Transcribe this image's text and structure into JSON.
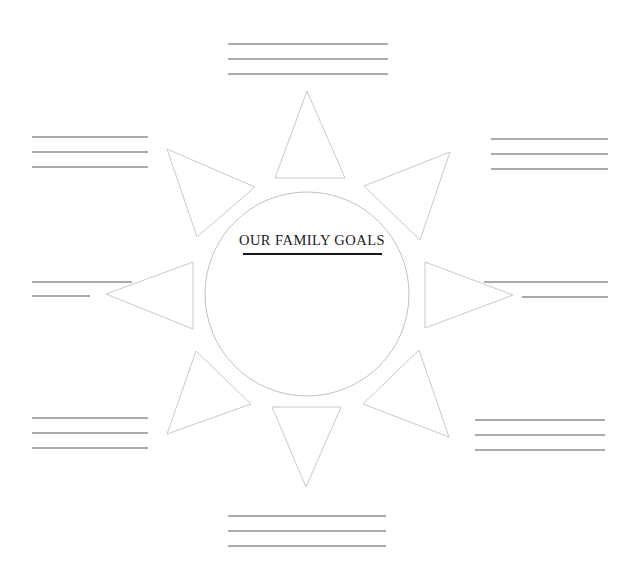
{
  "document": {
    "type": "graphic-organizer-worksheet",
    "theme": "sunburst",
    "title": "OUR FAMILY GOALS",
    "background_color": "#ffffff",
    "shape_stroke_color": "#c9c9cc",
    "line_stroke_color": "#8e8e92",
    "title_color": "#1a1a1a"
  },
  "center": {
    "label": "OUR FAMILY GOALS",
    "cx": 307,
    "cy": 294,
    "r": 102,
    "text_x": 312,
    "text_y": 245,
    "rule_x1": 243,
    "rule_x2": 382,
    "rule_y": 254
  },
  "rays": [
    {
      "name": "ray-top",
      "points": "307,91 345,178 275,178"
    },
    {
      "name": "ray-top-right",
      "points": "450,152 420,240 364,186"
    },
    {
      "name": "ray-right",
      "points": "513,295 425,328 425,262"
    },
    {
      "name": "ray-bottom-right",
      "points": "449,437 363,404 419,350"
    },
    {
      "name": "ray-bottom",
      "points": "306,487 272,407 341,407"
    },
    {
      "name": "ray-bottom-left",
      "points": "167,434 196,351 251,404"
    },
    {
      "name": "ray-left",
      "points": "106,294 193,262 193,329"
    },
    {
      "name": "ray-top-left",
      "points": "167,149 255,187 197,237"
    }
  ],
  "writing_groups": [
    {
      "name": "lines-top",
      "position": "top",
      "lines": [
        {
          "x1": 228,
          "x2": 388,
          "y": 44
        },
        {
          "x1": 228,
          "x2": 388,
          "y": 59
        },
        {
          "x1": 228,
          "x2": 388,
          "y": 74
        }
      ]
    },
    {
      "name": "lines-top-left",
      "position": "top-left",
      "lines": [
        {
          "x1": 32,
          "x2": 148,
          "y": 137
        },
        {
          "x1": 32,
          "x2": 148,
          "y": 152
        },
        {
          "x1": 32,
          "x2": 148,
          "y": 167
        }
      ]
    },
    {
      "name": "lines-top-right",
      "position": "top-right",
      "lines": [
        {
          "x1": 491,
          "x2": 608,
          "y": 139
        },
        {
          "x1": 491,
          "x2": 608,
          "y": 154
        },
        {
          "x1": 491,
          "x2": 608,
          "y": 169
        }
      ]
    },
    {
      "name": "lines-middle-left",
      "position": "middle-left",
      "lines": [
        {
          "x1": 32,
          "x2": 132,
          "y": 282
        },
        {
          "x1": 32,
          "x2": 90,
          "y": 296
        }
      ]
    },
    {
      "name": "lines-middle-right",
      "position": "middle-right",
      "lines": [
        {
          "x1": 484,
          "x2": 608,
          "y": 282
        },
        {
          "x1": 522,
          "x2": 608,
          "y": 297
        }
      ]
    },
    {
      "name": "lines-bottom-left",
      "position": "bottom-left",
      "lines": [
        {
          "x1": 32,
          "x2": 148,
          "y": 418
        },
        {
          "x1": 32,
          "x2": 148,
          "y": 433
        },
        {
          "x1": 32,
          "x2": 148,
          "y": 448
        }
      ]
    },
    {
      "name": "lines-bottom-right",
      "position": "bottom-right",
      "lines": [
        {
          "x1": 475,
          "x2": 605,
          "y": 420
        },
        {
          "x1": 475,
          "x2": 605,
          "y": 435
        },
        {
          "x1": 475,
          "x2": 605,
          "y": 450
        }
      ]
    },
    {
      "name": "lines-bottom",
      "position": "bottom",
      "lines": [
        {
          "x1": 228,
          "x2": 386,
          "y": 516
        },
        {
          "x1": 228,
          "x2": 386,
          "y": 531
        },
        {
          "x1": 228,
          "x2": 386,
          "y": 546
        }
      ]
    }
  ]
}
